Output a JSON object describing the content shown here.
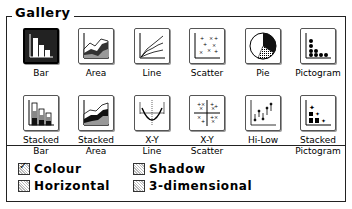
{
  "gallery": {
    "title": "Gallery",
    "selected": "Bar",
    "items": [
      {
        "label": "Bar",
        "icon": "bar-chart-icon"
      },
      {
        "label": "Area",
        "icon": "area-chart-icon"
      },
      {
        "label": "Line",
        "icon": "line-chart-icon"
      },
      {
        "label": "Scatter",
        "icon": "scatter-chart-icon"
      },
      {
        "label": "Pie",
        "icon": "pie-chart-icon"
      },
      {
        "label": "Pictogram",
        "icon": "pictogram-chart-icon"
      },
      {
        "label": "Stacked\nBar",
        "l1": "Stacked",
        "l2": "Bar",
        "icon": "stacked-bar-chart-icon"
      },
      {
        "label": "Stacked\nArea",
        "l1": "Stacked",
        "l2": "Area",
        "icon": "stacked-area-chart-icon"
      },
      {
        "label": "X-Y\nLine",
        "l1": "X-Y",
        "l2": "Line",
        "icon": "xy-line-chart-icon"
      },
      {
        "label": "X-Y\nScatter",
        "l1": "X-Y",
        "l2": "Scatter",
        "icon": "xy-scatter-chart-icon"
      },
      {
        "label": "Hi-Low",
        "l1": "Hi-Low",
        "l2": "",
        "icon": "hi-low-chart-icon"
      },
      {
        "label": "Stacked\nPictogram",
        "l1": "Stacked",
        "l2": "Pictogram",
        "icon": "stacked-pictogram-chart-icon"
      }
    ]
  },
  "options": [
    {
      "label": "Colour",
      "checked": true
    },
    {
      "label": "Horizontal",
      "checked": false
    },
    {
      "label": "Shadow",
      "checked": false
    },
    {
      "label": "3-dimensional",
      "checked": false
    }
  ]
}
